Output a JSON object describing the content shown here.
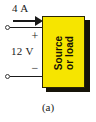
{
  "figure": {
    "caption": "(a)",
    "current_label": "4 A",
    "voltage_label": "12 V",
    "polarity_plus": "+",
    "polarity_minus": "−",
    "block_line1": "Source",
    "block_line2": "or load",
    "colors": {
      "block_fill": "#f6e500",
      "block_shadow": "#171409",
      "wire": "#1a1a1a",
      "background": "#ffffff",
      "text": "#1a1a1a"
    }
  }
}
